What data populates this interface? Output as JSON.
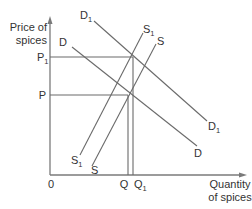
{
  "diagram": {
    "type": "supply-demand",
    "y_axis_label_line1": "Price of",
    "y_axis_label_line2": "spices",
    "x_axis_label_line1": "Quantity",
    "x_axis_label_line2": "of spices",
    "origin_label": "0",
    "price_labels": {
      "p1_main": "P",
      "p1_sub": "1",
      "p": "P"
    },
    "quantity_labels": {
      "q": "Q",
      "q1_main": "Q",
      "q1_sub": "1"
    },
    "curves": {
      "d1": {
        "main": "D",
        "sub": "1"
      },
      "d": {
        "main": "D"
      },
      "s1": {
        "main": "S",
        "sub": "1"
      },
      "s": {
        "main": "S"
      }
    },
    "colors": {
      "line": "#6a6a6a",
      "axis": "#7a7a7a",
      "text": "#333333"
    }
  }
}
